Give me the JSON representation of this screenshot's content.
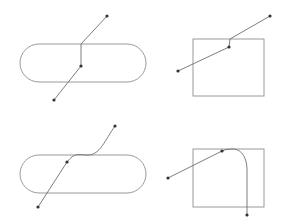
{
  "diagram": {
    "colors": {
      "shape_stroke": "#9a9a9a",
      "edge_stroke": "#6e6e6e",
      "point_fill": "#333333",
      "background": "#ffffff"
    },
    "panels": [
      {
        "id": "top-left",
        "shape": {
          "type": "stadium",
          "x": 20,
          "y": 44,
          "w": 126,
          "h": 38
        },
        "points": [
          [
            107,
            16
          ],
          [
            81,
            66
          ],
          [
            54,
            100
          ]
        ],
        "edge_style": "orthogonal-segment"
      },
      {
        "id": "top-right",
        "shape": {
          "type": "rectangle",
          "x": 193,
          "y": 39,
          "w": 71,
          "h": 57
        },
        "points": [
          [
            270,
            16
          ],
          [
            229,
            47
          ],
          [
            178,
            71
          ]
        ],
        "edge_style": "orthogonal-segment"
      },
      {
        "id": "bottom-left",
        "shape": {
          "type": "stadium",
          "x": 20,
          "y": 155,
          "w": 126,
          "h": 38
        },
        "points": [
          [
            115,
            126
          ],
          [
            67,
            162
          ],
          [
            38,
            207
          ]
        ],
        "edge_style": "curved"
      },
      {
        "id": "bottom-right",
        "shape": {
          "type": "rectangle",
          "x": 193,
          "y": 149,
          "w": 71,
          "h": 58
        },
        "points": [
          [
            168,
            178
          ],
          [
            222,
            151
          ],
          [
            247,
            215
          ]
        ],
        "edge_style": "curved"
      }
    ]
  }
}
